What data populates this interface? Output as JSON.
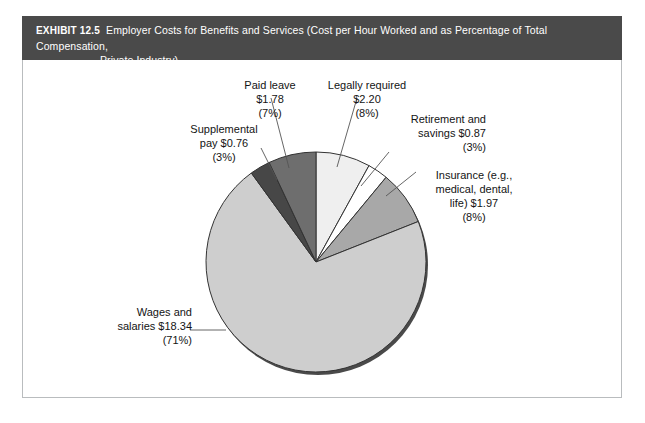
{
  "header": {
    "tag": "EXHIBIT 12.5",
    "title_line1": "Employer Costs for Benefits and Services (Cost per Hour Worked and as Percentage of Total Compensation,",
    "title_line2": "Private Industry)",
    "bar_color": "#4a4a4a",
    "text_color": "#ffffff"
  },
  "chart_data": {
    "type": "pie",
    "title": "Employer Costs for Benefits and Services (Cost per Hour Worked and as Percentage of Total Compensation, Private Industry)",
    "xlabel": "",
    "ylabel": "",
    "unit": "dollars per hour worked",
    "legend_position": "callout-labels",
    "grid": false,
    "start_angle_deg": -90,
    "direction": "counterclockwise",
    "categories": [
      "Wages and salaries",
      "Paid leave",
      "Supplemental pay",
      "Insurance (e.g., medical, dental, life)",
      "Retirement and savings",
      "Legally required"
    ],
    "values": [
      18.34,
      1.78,
      0.76,
      1.97,
      0.87,
      2.2
    ],
    "percentages": [
      71,
      7,
      3,
      8,
      3,
      8
    ],
    "colors": [
      "#cecece",
      "#6e6e6e",
      "#474747",
      "#a8a8a8",
      "#ffffff",
      "#efefef"
    ],
    "slices": [
      {
        "name": "Wages and salaries",
        "value": 18.34,
        "value_label": "$18.34",
        "percent": 71,
        "percent_label": "(71%)",
        "color": "#cecece"
      },
      {
        "name": "Paid leave",
        "value": 1.78,
        "value_label": "$1.78",
        "percent": 7,
        "percent_label": "(7%)",
        "color": "#6e6e6e"
      },
      {
        "name": "Supplemental pay",
        "value": 0.76,
        "value_label": "$0.76",
        "percent": 3,
        "percent_label": "(3%)",
        "color": "#474747"
      },
      {
        "name": "Insurance (e.g., medical, dental, life)",
        "value": 1.97,
        "value_label": "$1.97",
        "percent": 8,
        "percent_label": "(8%)",
        "color": "#a8a8a8"
      },
      {
        "name": "Retirement and savings",
        "value": 0.87,
        "value_label": "$0.87",
        "percent": 3,
        "percent_label": "(3%)",
        "color": "#ffffff"
      },
      {
        "name": "Legally required",
        "value": 2.2,
        "value_label": "$2.20",
        "percent": 8,
        "percent_label": "(8%)",
        "color": "#efefef"
      }
    ]
  },
  "callouts": {
    "paid_leave": "Paid leave\n$1.78\n(7%)",
    "legally_required": "Legally required\n$2.20\n(8%)",
    "supplemental_pay": "Supplemental\npay $0.76\n(3%)",
    "retirement_savings": "Retirement and\nsavings $0.87\n(3%)",
    "insurance": "Insurance (e.g.,\nmedical, dental,\nlife) $1.97\n(8%)",
    "wages_salaries": "Wages and\nsalaries $18.34\n(71%)"
  },
  "style": {
    "page_background": "#ffffff",
    "frame_border": "#b9bcbe",
    "pie_outline": "#333333",
    "leader_line": "#555555",
    "shadow": "#4a4a4a"
  }
}
